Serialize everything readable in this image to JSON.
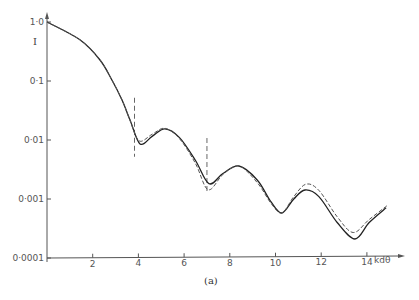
{
  "chart_data": {
    "type": "line",
    "title": "",
    "caption": "(a)",
    "xlabel": "kdθ",
    "ylabel": "I",
    "yscale": "log",
    "xlim": [
      0,
      15.5
    ],
    "ylim": [
      0.0001,
      1.0
    ],
    "grid": false,
    "legend": "none",
    "x_ticks": [
      2,
      4,
      6,
      8,
      10,
      12,
      14
    ],
    "x_tick_labels": [
      "2",
      "4",
      "6",
      "8",
      "10",
      "12",
      "14"
    ],
    "y_ticks": [
      1.0,
      0.1,
      0.01,
      0.001,
      0.0001
    ],
    "y_tick_labels": [
      "1·0",
      "0·1",
      "0·01",
      "0·001",
      "0·0001"
    ],
    "series": [
      {
        "name": "solid",
        "style": "solid",
        "x": [
          0,
          1.44,
          2.32,
          2.84,
          3.28,
          3.63,
          4.07,
          4.6,
          5.16,
          5.8,
          6.5,
          7.09,
          7.7,
          8.4,
          9.2,
          9.8,
          10.28,
          10.8,
          11.29,
          11.9,
          12.7,
          13.48,
          14.1,
          14.84
        ],
        "y": [
          1.0,
          0.5,
          0.227,
          0.104,
          0.048,
          0.022,
          0.0086,
          0.0115,
          0.0154,
          0.011,
          0.0045,
          0.00182,
          0.0027,
          0.00362,
          0.0021,
          0.0009,
          0.00058,
          0.001,
          0.00142,
          0.0011,
          0.0004,
          0.00021,
          0.0004,
          0.00071
        ]
      },
      {
        "name": "dashed",
        "style": "dashed",
        "x": [
          0,
          1.44,
          2.32,
          2.84,
          3.28,
          3.63,
          4.03,
          4.6,
          5.16,
          5.8,
          6.5,
          7.05,
          7.7,
          8.4,
          9.2,
          9.8,
          10.28,
          10.8,
          11.33,
          11.9,
          12.7,
          13.4,
          14.1,
          14.88
        ],
        "y": [
          1.0,
          0.5,
          0.227,
          0.104,
          0.048,
          0.022,
          0.0097,
          0.0125,
          0.0158,
          0.0105,
          0.004,
          0.00144,
          0.0026,
          0.00362,
          0.0019,
          0.00085,
          0.00058,
          0.0011,
          0.00178,
          0.0014,
          0.0005,
          0.00027,
          0.00045,
          0.00077
        ]
      }
    ],
    "annotations": [
      {
        "type": "vline",
        "style": "dashed",
        "x": 3.83,
        "y_from": 0.052,
        "y_to": 0.0052
      },
      {
        "type": "vline",
        "style": "dashed",
        "x": 7.0,
        "y_from": 0.0108,
        "y_to": 0.00125
      }
    ]
  }
}
